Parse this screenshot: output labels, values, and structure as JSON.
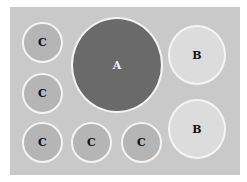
{
  "diagram": {
    "colors": {
      "board": "#c9c9c9",
      "large_circle": "#6a6a6a",
      "medium_circle": "#dcdcdc",
      "small_circle": "#b5b5b5",
      "outline": "#f4f4f4"
    },
    "circles": [
      {
        "label": "C",
        "size": "small"
      },
      {
        "label": "A",
        "size": "large"
      },
      {
        "label": "B",
        "size": "medium"
      },
      {
        "label": "C",
        "size": "small"
      },
      {
        "label": "C",
        "size": "small"
      },
      {
        "label": "C",
        "size": "small"
      },
      {
        "label": "C",
        "size": "small"
      },
      {
        "label": "B",
        "size": "medium"
      }
    ]
  }
}
